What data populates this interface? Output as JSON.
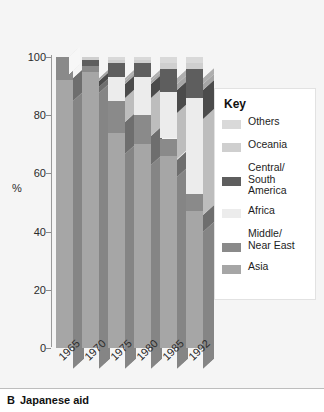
{
  "caption": {
    "letter": "B",
    "text": "Japanese aid"
  },
  "legend": {
    "title": "Key",
    "items": [
      {
        "label": "Others",
        "color": "#d9d9d9"
      },
      {
        "label": "Oceania",
        "color": "#cfcfcf"
      },
      {
        "label": "Central/\nSouth\nAmerica",
        "color": "#5e5e5e"
      },
      {
        "label": "Africa",
        "color": "#ececec"
      },
      {
        "label": "Middle/\nNear East",
        "color": "#8a8a8a"
      },
      {
        "label": "Asia",
        "color": "#a6a6a6"
      }
    ]
  },
  "chart_data": {
    "type": "bar",
    "subtype": "stacked-3d",
    "title": "Japanese aid",
    "xlabel": "",
    "ylabel": "%",
    "ylim": [
      0,
      100
    ],
    "yticks": [
      0,
      20,
      40,
      60,
      80,
      100
    ],
    "ytick_labels": [
      "0",
      "20",
      "40",
      "60",
      "80",
      "100"
    ],
    "grid": false,
    "legend_position": "right",
    "categories": [
      "1965",
      "1970",
      "1975",
      "1980",
      "1985",
      "1992"
    ],
    "series": [
      {
        "name": "Asia",
        "color": "#a6a6a6",
        "values": [
          92,
          95,
          74,
          70,
          66,
          47
        ]
      },
      {
        "name": "Middle/Near East",
        "color": "#8a8a8a",
        "values": [
          8,
          2,
          11,
          10,
          6,
          6
        ]
      },
      {
        "name": "Africa",
        "color": "#ececec",
        "values": [
          0,
          0,
          8,
          13,
          16,
          33
        ]
      },
      {
        "name": "Central/South America",
        "color": "#5e5e5e",
        "values": [
          0,
          2,
          5,
          5,
          8,
          10
        ]
      },
      {
        "name": "Oceania",
        "color": "#cfcfcf",
        "values": [
          0,
          1,
          1,
          1,
          2,
          2
        ]
      },
      {
        "name": "Others",
        "color": "#d9d9d9",
        "values": [
          0,
          0,
          1,
          1,
          2,
          2
        ]
      }
    ]
  }
}
